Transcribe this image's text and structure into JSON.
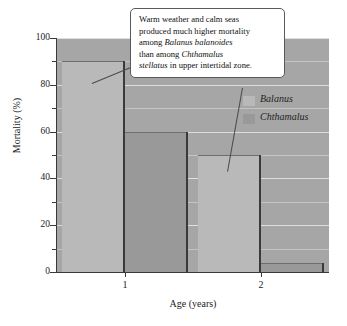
{
  "chart_data": {
    "type": "bar",
    "title": "",
    "xlabel": "Age (years)",
    "ylabel": "Mortality (%)",
    "categories": [
      "1",
      "2"
    ],
    "series": [
      {
        "name": "Balanus",
        "values": [
          90,
          50
        ],
        "color": "#b9b9b9"
      },
      {
        "name": "Chthamalus",
        "values": [
          60,
          4
        ],
        "color": "#999999"
      }
    ],
    "ylim": [
      0,
      100
    ],
    "yticks": [
      0,
      20,
      40,
      60,
      80,
      100
    ],
    "yticks_minor": [
      10,
      30,
      50,
      70,
      90
    ],
    "grid": true,
    "legend_position": "inside-top-right",
    "plot_background": "#a6a6a6"
  },
  "axes": {
    "y_title": "Mortality (%)",
    "x_title": "Age (years)",
    "y_tick_labels": [
      "0",
      "20",
      "40",
      "60",
      "80",
      "100"
    ],
    "x_tick_labels": [
      "1",
      "2"
    ]
  },
  "legend": {
    "items": [
      {
        "label": "Balanus",
        "color": "#b9b9b9"
      },
      {
        "label": "Chthamalus",
        "color": "#999999"
      }
    ]
  },
  "callout": {
    "line1_a": "Warm weather and calm seas",
    "line2_a": "produced much higher mortality",
    "line3_a": "among ",
    "line3_i": "Balanus balanoides",
    "line4_a": "than among ",
    "line4_i": "Chthamalus",
    "line5_i": "stellatus",
    "line5_b": " in upper intertidal zone."
  }
}
